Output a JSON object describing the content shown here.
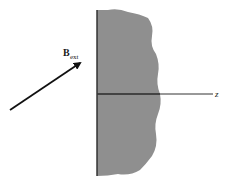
{
  "diagram": {
    "vector_label": {
      "main": "B",
      "subscript": "ext"
    },
    "axis_label": "z",
    "colors": {
      "material_fill": "#8f8f8f",
      "edge": "#2a2a2a",
      "arrow": "#111111",
      "axis": "#333333"
    }
  }
}
